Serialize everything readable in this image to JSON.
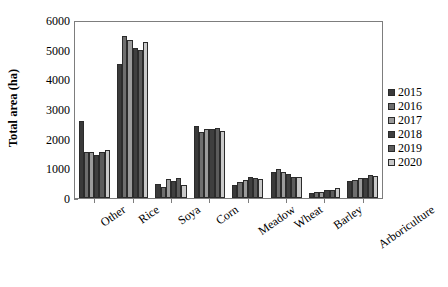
{
  "chart_data": {
    "type": "bar",
    "title": "",
    "xlabel": "",
    "ylabel": "Total area (ha)",
    "ylim": [
      0,
      6000
    ],
    "ytick_values": [
      0,
      1000,
      2000,
      3000,
      4000,
      5000,
      6000
    ],
    "ytick_labels": [
      "0",
      "1000",
      "2000",
      "3000",
      "4000",
      "5000",
      "6000"
    ],
    "grid": false,
    "legend_position": "right",
    "categories": [
      "Other",
      "Rice",
      "Soya",
      "Corn",
      "Meadow",
      "Wheat",
      "Barley",
      "Arboriculture"
    ],
    "series": [
      {
        "name": "2015",
        "color": "#3a3a3a",
        "values": [
          2590,
          4520,
          460,
          2430,
          440,
          880,
          170,
          570
        ]
      },
      {
        "name": "2016",
        "color": "#6e6e6e",
        "values": [
          1560,
          5460,
          370,
          2230,
          530,
          980,
          200,
          620
        ]
      },
      {
        "name": "2017",
        "color": "#9b9b9b",
        "values": [
          1540,
          5330,
          640,
          2310,
          600,
          870,
          210,
          660
        ]
      },
      {
        "name": "2018",
        "color": "#3f3f3f",
        "values": [
          1460,
          5060,
          570,
          2340,
          700,
          810,
          270,
          690
        ]
      },
      {
        "name": "2019",
        "color": "#5c5c5c",
        "values": [
          1540,
          4990,
          660,
          2350,
          660,
          720,
          280,
          760
        ]
      },
      {
        "name": "2020",
        "color": "#c9c9c9",
        "values": [
          1620,
          5250,
          450,
          2250,
          650,
          700,
          340,
          730
        ]
      }
    ]
  },
  "legend": {
    "items": [
      {
        "label": "2015"
      },
      {
        "label": "2016"
      },
      {
        "label": "2017"
      },
      {
        "label": "2018"
      },
      {
        "label": "2019"
      },
      {
        "label": "2020"
      }
    ]
  },
  "axes": {
    "y_title": "Total area (ha)"
  }
}
